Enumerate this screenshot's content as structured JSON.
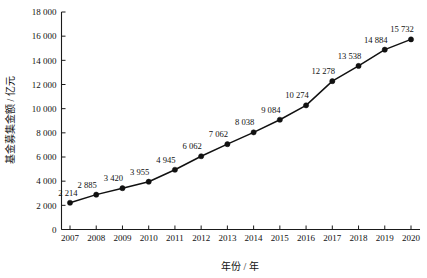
{
  "chart_data": {
    "type": "line",
    "title": "",
    "xlabel": "年份 / 年",
    "ylabel": "基金募集金额 / 亿元",
    "categories": [
      "2007",
      "2008",
      "2009",
      "2010",
      "2011",
      "2012",
      "2013",
      "2014",
      "2015",
      "2016",
      "2017",
      "2018",
      "2019",
      "2020"
    ],
    "values": [
      2214,
      2885,
      3420,
      3955,
      4945,
      6062,
      7062,
      8038,
      9084,
      10274,
      12278,
      13538,
      14884,
      15732
    ],
    "point_labels": [
      "2 214",
      "2 885",
      "3 420",
      "3 955",
      "4 945",
      "6 062",
      "7 062",
      "8 038",
      "9 084",
      "10 274",
      "12 278",
      "13 538",
      "14 884",
      "15 732"
    ],
    "ylim": [
      0,
      18000
    ],
    "ytick_values": [
      0,
      2000,
      4000,
      6000,
      8000,
      10000,
      12000,
      14000,
      16000,
      18000
    ],
    "ytick_labels": [
      "0",
      "2 000",
      "4 000",
      "6 000",
      "8 000",
      "10 000",
      "12 000",
      "14 000",
      "16 000",
      "18 000"
    ],
    "grid": false,
    "legend": "none",
    "series_name": "基金募集金额",
    "marker": "filled-circle",
    "line_color": "#111111",
    "marker_color": "#111111",
    "background_color": "#ffffff"
  }
}
